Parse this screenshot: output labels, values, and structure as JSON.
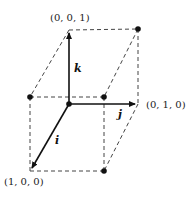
{
  "diagram": {
    "type": "unit-cube-basis-vectors",
    "labels": {
      "k_point": "(0, 0, 1)",
      "j_point": "(0, 1, 0)",
      "i_point": "(1, 0, 0)"
    },
    "vectors": {
      "i": "i",
      "j": "j",
      "k": "k"
    },
    "colors": {
      "line": "#111111",
      "dashed": "#444444",
      "background": "#ffffff"
    }
  }
}
